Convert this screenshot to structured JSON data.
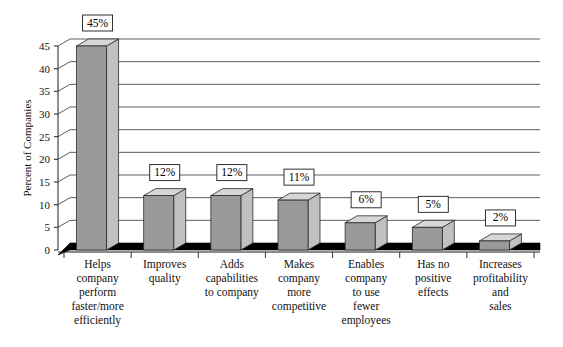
{
  "chart_data": {
    "type": "bar",
    "title": "",
    "xlabel": "",
    "ylabel": "Percent of Companies",
    "ylim": [
      0,
      45
    ],
    "ytick_step": 5,
    "yticks": [
      "0",
      "5",
      "10",
      "15",
      "20",
      "25",
      "30",
      "35",
      "40",
      "45"
    ],
    "grid": true,
    "legend": "none",
    "style": "3d-column",
    "categories": [
      "Helps company perform faster/more efficiently",
      "Improves quality",
      "Adds capabilities to company",
      "Makes company more competitive",
      "Enables company to use fewer employees",
      "Has no positive effects",
      "Increases profitability and sales"
    ],
    "category_lines": [
      [
        "Helps",
        "company",
        "perform",
        "faster/more",
        "efficiently"
      ],
      [
        "Improves",
        "quality"
      ],
      [
        "Adds",
        "capabilities",
        "to company"
      ],
      [
        "Makes",
        "company",
        "more",
        "competitive"
      ],
      [
        "Enables",
        "company",
        "to use",
        "fewer",
        "employees"
      ],
      [
        "Has no",
        "positive",
        "effects"
      ],
      [
        "Increases",
        "profitability",
        "and",
        "sales"
      ]
    ],
    "values": [
      45,
      12,
      12,
      11,
      6,
      5,
      2
    ],
    "data_labels": [
      "45%",
      "12%",
      "12%",
      "11%",
      "6%",
      "5%",
      "2%"
    ],
    "colors": {
      "bar_front": "#9a9a9a",
      "bar_side": "#c0c0c0",
      "bar_top": "#d6d6d6",
      "bar_outline": "#2b2b2b",
      "gridline": "#4a4a4a",
      "axis": "#333333",
      "floor": "#000000",
      "label_box_fill": "#ffffff",
      "label_box_border": "#1a1a1a",
      "background": "#ffffff",
      "text": "#111111"
    }
  }
}
